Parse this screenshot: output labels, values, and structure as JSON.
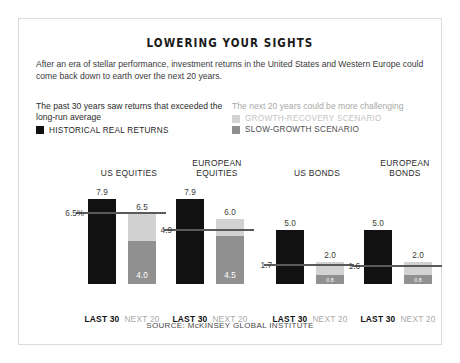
{
  "title": "LOWERING YOUR SIGHTS",
  "subtitle": "After an era of stellar performance, investment returns in the United States and Western Europe could come back down to earth over the next 20 years.",
  "legend": {
    "left": {
      "heading": "The past 30 years saw returns that exceeded the long-run average",
      "items": [
        {
          "label": "HISTORICAL REAL RETURNS",
          "color": "#111111"
        }
      ]
    },
    "right": {
      "heading": "The next 20 years could be more challenging",
      "items": [
        {
          "label": "GROWTH-RECOVERY SCENARIO",
          "color": "#d3d3d3"
        },
        {
          "label": "SLOW-GROWTH SCENARIO",
          "color": "#8f8f8f"
        }
      ]
    }
  },
  "reference_note": "Last 100 years average return",
  "category_labels": {
    "left": "LAST 30",
    "right": "NEXT 20"
  },
  "source": "SOURCE: McKINSEY GLOBAL INSTITUTE",
  "chart_data": {
    "type": "bar",
    "title": "LOWERING YOUR SIGHTS",
    "subtitle": "After an era of stellar performance, investment returns in the United States and Western Europe could come back down to earth over the next 20 years.",
    "xlabel": "",
    "ylabel": "Real return (%)",
    "ylim": [
      0,
      9
    ],
    "grid": false,
    "legend_position": "top",
    "categories": [
      "US EQUITIES",
      "EUROPEAN EQUITIES",
      "US BONDS",
      "EUROPEAN BONDS"
    ],
    "series": [
      {
        "name": "HISTORICAL REAL RETURNS",
        "color": "#111111",
        "values": [
          7.9,
          7.9,
          5.0,
          5.0
        ]
      },
      {
        "name": "GROWTH-RECOVERY SCENARIO",
        "color": "#d3d3d3",
        "values": [
          6.5,
          6.0,
          2.0,
          2.0
        ]
      },
      {
        "name": "SLOW-GROWTH SCENARIO",
        "color": "#8f8f8f",
        "values": [
          4.0,
          4.5,
          0.8,
          0.8
        ]
      }
    ],
    "reference_lines": [
      {
        "category": "US EQUITIES",
        "value": 6.5,
        "label": "6.5%",
        "note": "Last 100 years average return"
      },
      {
        "category": "EUROPEAN EQUITIES",
        "value": 4.9,
        "label": "4.9"
      },
      {
        "category": "US BONDS",
        "value": 1.7,
        "label": "1.7"
      },
      {
        "category": "EUROPEAN BONDS",
        "value": 1.6,
        "label": "1.6"
      }
    ],
    "annotations": [
      "SOURCE: McKINSEY GLOBAL INSTITUTE"
    ]
  },
  "groups": [
    {
      "title_line1": "US EQUITIES",
      "title_line2": "",
      "historical": "7.9",
      "recovery": "6.5",
      "slow": "4.0",
      "ref_label": "6.5%"
    },
    {
      "title_line1": "EUROPEAN",
      "title_line2": "EQUITIES",
      "historical": "7.9",
      "recovery": "6.0",
      "slow": "4.5",
      "ref_label": "4.9"
    },
    {
      "title_line1": "US BONDS",
      "title_line2": "",
      "historical": "5.0",
      "recovery": "2.0",
      "slow": "0.8",
      "ref_label": "1.7"
    },
    {
      "title_line1": "EUROPEAN",
      "title_line2": "BONDS",
      "historical": "5.0",
      "recovery": "2.0",
      "slow": "0.8",
      "ref_label": "1.6"
    }
  ]
}
